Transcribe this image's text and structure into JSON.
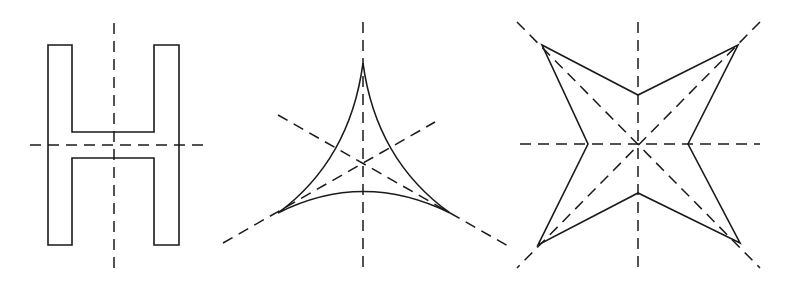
{
  "diagram": {
    "colors": {
      "background": "#ffffff",
      "stroke": "#1a1a1a"
    },
    "figures": [
      {
        "name": "H-shape",
        "symmetry_axes": 2,
        "outline": "48,45 72,45 72,132 154,132 154,45 179,45 179,245 154,245 154,158 72,158 72,245 48,245",
        "axes": [
          {
            "x1": 114,
            "y1": 23,
            "x2": 114,
            "y2": 268
          },
          {
            "x1": 30,
            "y1": 145,
            "x2": 210,
            "y2": 145
          }
        ]
      },
      {
        "name": "curved-triangle",
        "symmetry_axes": 3,
        "outline": "M363,63 Q350,160 278,213 Q363,170 450,213 Q376,160 363,63 Z",
        "axes": [
          {
            "x1": 363,
            "y1": 22,
            "x2": 363,
            "y2": 268
          },
          {
            "x1": 278,
            "y1": 115,
            "x2": 500,
            "y2": 242
          },
          {
            "x1": 223,
            "y1": 243,
            "x2": 435,
            "y2": 122
          }
        ]
      },
      {
        "name": "four-point-star",
        "symmetry_axes": 4,
        "outline": "542,45 638,95 738,45 688,144 740,243 638,193 538,245 588,144",
        "axes": [
          {
            "x1": 638,
            "y1": 22,
            "x2": 638,
            "y2": 268
          },
          {
            "x1": 520,
            "y1": 144,
            "x2": 760,
            "y2": 144
          },
          {
            "x1": 517,
            "y1": 22,
            "x2": 760,
            "y2": 268
          },
          {
            "x1": 760,
            "y1": 22,
            "x2": 517,
            "y2": 268
          }
        ]
      }
    ]
  }
}
